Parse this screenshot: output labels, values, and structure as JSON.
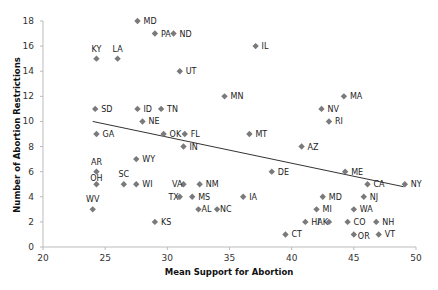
{
  "chart_data": {
    "type": "scatter",
    "title": "",
    "xlabel": "Mean Support for Abortion",
    "ylabel": "Number of Abortion Restrictions",
    "xlim": [
      20,
      50
    ],
    "ylim": [
      0,
      18
    ],
    "xticks": [
      20,
      25,
      30,
      35,
      40,
      45,
      50
    ],
    "yticks": [
      0,
      2,
      4,
      6,
      8,
      10,
      12,
      14,
      16,
      18
    ],
    "grid": false,
    "legend": null,
    "marker_color": "#7a7a7a",
    "trendline": {
      "x": [
        24.0,
        49.0
      ],
      "y": [
        10.0,
        4.8
      ],
      "color": "#333333"
    },
    "points": [
      {
        "label": "MD",
        "x": 27.6,
        "y": 18
      },
      {
        "label": "PA",
        "x": 29.0,
        "y": 17
      },
      {
        "label": "ND",
        "x": 30.5,
        "y": 17
      },
      {
        "label": "KY",
        "x": 24.3,
        "y": 15
      },
      {
        "label": "LA",
        "x": 26.0,
        "y": 15
      },
      {
        "label": "IL",
        "x": 37.1,
        "y": 16
      },
      {
        "label": "UT",
        "x": 31.0,
        "y": 14
      },
      {
        "label": "MN",
        "x": 34.6,
        "y": 12
      },
      {
        "label": "MA",
        "x": 44.2,
        "y": 12
      },
      {
        "label": "SD",
        "x": 24.2,
        "y": 11
      },
      {
        "label": "ID",
        "x": 27.6,
        "y": 11
      },
      {
        "label": "TN",
        "x": 29.5,
        "y": 11
      },
      {
        "label": "NV",
        "x": 42.4,
        "y": 11
      },
      {
        "label": "NE",
        "x": 28.0,
        "y": 10
      },
      {
        "label": "RI",
        "x": 43.0,
        "y": 10
      },
      {
        "label": "GA",
        "x": 24.3,
        "y": 9
      },
      {
        "label": "OK",
        "x": 29.7,
        "y": 9
      },
      {
        "label": "FL",
        "x": 31.4,
        "y": 9
      },
      {
        "label": "MT",
        "x": 36.6,
        "y": 9
      },
      {
        "label": "IN",
        "x": 31.3,
        "y": 8
      },
      {
        "label": "AZ",
        "x": 40.8,
        "y": 8
      },
      {
        "label": "WY",
        "x": 27.5,
        "y": 7
      },
      {
        "label": "AR",
        "x": 24.3,
        "y": 6
      },
      {
        "label": "DE",
        "x": 38.4,
        "y": 6
      },
      {
        "label": "ME",
        "x": 44.3,
        "y": 6
      },
      {
        "label": "OH",
        "x": 24.3,
        "y": 5
      },
      {
        "label": "SC",
        "x": 26.5,
        "y": 5
      },
      {
        "label": "WI",
        "x": 27.5,
        "y": 5
      },
      {
        "label": "VA",
        "x": 31.3,
        "y": 5
      },
      {
        "label": "NM",
        "x": 32.6,
        "y": 5
      },
      {
        "label": "CA",
        "x": 46.1,
        "y": 5
      },
      {
        "label": "NY",
        "x": 49.1,
        "y": 5
      },
      {
        "label": "TX",
        "x": 31.0,
        "y": 4
      },
      {
        "label": "MS",
        "x": 32.0,
        "y": 4
      },
      {
        "label": "IA",
        "x": 36.1,
        "y": 4
      },
      {
        "label": "MD",
        "x": 42.5,
        "y": 4
      },
      {
        "label": "NJ",
        "x": 45.8,
        "y": 4
      },
      {
        "label": "WV",
        "x": 24.0,
        "y": 3
      },
      {
        "label": "AL",
        "x": 32.5,
        "y": 3
      },
      {
        "label": "NC",
        "x": 34.0,
        "y": 3
      },
      {
        "label": "MI",
        "x": 42.0,
        "y": 3
      },
      {
        "label": "WA",
        "x": 45.0,
        "y": 3
      },
      {
        "label": "KS",
        "x": 29.0,
        "y": 2
      },
      {
        "label": "HI",
        "x": 41.1,
        "y": 2
      },
      {
        "label": "AK",
        "x": 43.0,
        "y": 2
      },
      {
        "label": "CO",
        "x": 44.5,
        "y": 2
      },
      {
        "label": "NH",
        "x": 46.8,
        "y": 2
      },
      {
        "label": "CT",
        "x": 39.5,
        "y": 1
      },
      {
        "label": "OR",
        "x": 45.0,
        "y": 1
      },
      {
        "label": "VT",
        "x": 47.0,
        "y": 1
      }
    ],
    "label_positions": {
      "KY": "above",
      "LA": "above",
      "AR": "above",
      "OH": "above-on",
      "SC": "above",
      "WV": "above",
      "VA": "left",
      "TX": "left",
      "AK": "left",
      "OR": "right-low",
      "NC": "right-close",
      "AL": "right-close"
    }
  }
}
